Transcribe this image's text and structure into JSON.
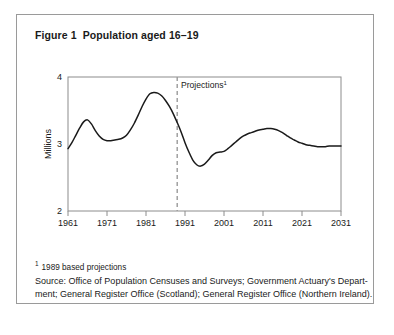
{
  "figure": {
    "label": "Figure 1",
    "title": "Population aged 16–19"
  },
  "footnote": {
    "marker": "1",
    "text": "1989 based projections"
  },
  "source": {
    "line1": "Source: Office of Population Censuses and Surveys; Government Actuary's Depart-",
    "line2": "ment; General Register Office (Scotland); General Register Office (Northern Ireland)."
  },
  "chart_data": {
    "type": "line",
    "title": "Population aged 16–19",
    "xlabel": "",
    "ylabel": "Millions",
    "xlim": [
      1961,
      2031
    ],
    "ylim": [
      2,
      4
    ],
    "grid": false,
    "legend": null,
    "xticks": [
      "1961",
      "1971",
      "1981",
      "1991",
      "2001",
      "2011",
      "2021",
      "2031"
    ],
    "xtick_values": [
      1961,
      1971,
      1981,
      1991,
      2001,
      2011,
      2021,
      2031
    ],
    "yticks": [
      "2",
      "3",
      "4"
    ],
    "ytick_values": [
      2,
      3,
      4
    ],
    "annotations": [
      {
        "name": "projections-divider",
        "type": "vline",
        "x": 1989,
        "style": "dashed",
        "label": "Projections",
        "label_sup": "1"
      }
    ],
    "series": [
      {
        "name": "Population aged 16-19 (millions)",
        "color": "#1a1a1a",
        "x": [
          1961,
          1962,
          1963,
          1964,
          1965,
          1966,
          1967,
          1968,
          1969,
          1970,
          1971,
          1972,
          1973,
          1974,
          1975,
          1976,
          1977,
          1978,
          1979,
          1980,
          1981,
          1982,
          1983,
          1984,
          1985,
          1986,
          1987,
          1988,
          1989,
          1990,
          1991,
          1992,
          1993,
          1994,
          1995,
          1996,
          1997,
          1998,
          1999,
          2000,
          2001,
          2002,
          2003,
          2004,
          2005,
          2006,
          2007,
          2008,
          2009,
          2010,
          2011,
          2012,
          2013,
          2014,
          2015,
          2016,
          2017,
          2018,
          2019,
          2020,
          2021,
          2022,
          2023,
          2024,
          2025,
          2026,
          2027,
          2028,
          2029,
          2030,
          2031
        ],
        "y": [
          2.93,
          3.02,
          3.13,
          3.24,
          3.33,
          3.36,
          3.3,
          3.2,
          3.12,
          3.07,
          3.05,
          3.05,
          3.06,
          3.07,
          3.09,
          3.13,
          3.21,
          3.31,
          3.43,
          3.56,
          3.67,
          3.75,
          3.77,
          3.76,
          3.72,
          3.65,
          3.56,
          3.45,
          3.32,
          3.18,
          3.02,
          2.88,
          2.76,
          2.69,
          2.67,
          2.7,
          2.76,
          2.83,
          2.87,
          2.88,
          2.89,
          2.93,
          2.98,
          3.03,
          3.08,
          3.12,
          3.15,
          3.17,
          3.19,
          3.21,
          3.22,
          3.23,
          3.23,
          3.22,
          3.2,
          3.17,
          3.13,
          3.09,
          3.06,
          3.03,
          3.01,
          2.99,
          2.98,
          2.97,
          2.96,
          2.96,
          2.96,
          2.97,
          2.97,
          2.97,
          2.97
        ]
      }
    ]
  }
}
